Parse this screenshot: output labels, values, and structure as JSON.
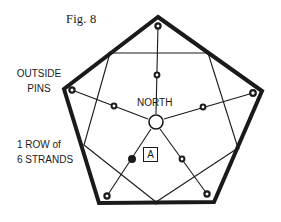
{
  "figure": {
    "title": "Fig. 8",
    "labels": {
      "outside_pins_line1": "OUTSIDE",
      "outside_pins_line2": "PINS",
      "row_line1": "1 ROW of",
      "row_line2": "6 STRANDS",
      "north": "NORTH",
      "marker": "A"
    },
    "colors": {
      "ink": "#1a1a1a",
      "background": "#ffffff"
    },
    "shapes": {
      "outer_frame": "pentagon",
      "center_ring": "circle",
      "pins": "small rings at each vertex and on each spoke"
    }
  }
}
